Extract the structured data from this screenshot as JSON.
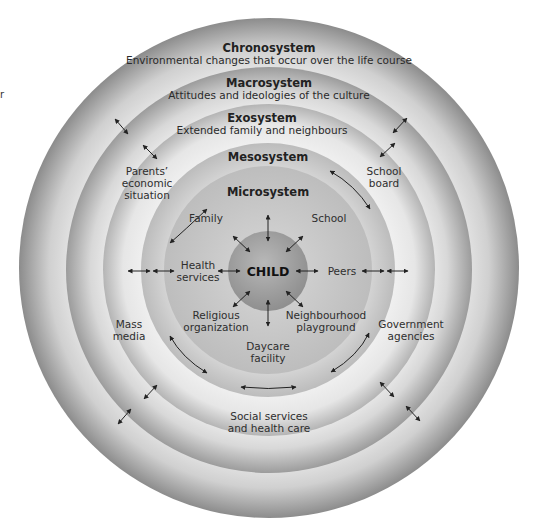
{
  "edge_fragment": "r",
  "systems": {
    "chronosystem": {
      "title": "Chronosystem",
      "subtitle": "Environmental changes that occur over the life course"
    },
    "macrosystem": {
      "title": "Macrosystem",
      "subtitle": "Attitudes and ideologies of the culture"
    },
    "exosystem": {
      "title": "Exosystem",
      "subtitle": "Extended family and neighbours"
    },
    "mesosystem": {
      "title": "Mesosystem"
    },
    "microsystem": {
      "title": "Microsystem"
    }
  },
  "center": {
    "label": "CHILD"
  },
  "microsystem_items": {
    "family": "Family",
    "school": "School",
    "health_services": [
      "Health",
      "services"
    ],
    "peers": "Peers",
    "religious_organization": [
      "Religious",
      "organization"
    ],
    "neighbourhood_playground": [
      "Neighbourhood",
      "playground"
    ],
    "daycare_facility": [
      "Daycare",
      "facility"
    ]
  },
  "exosystem_items": {
    "parents_economic_situation": [
      "Parents’",
      "economic",
      "situation"
    ],
    "school_board": [
      "School",
      "board"
    ],
    "mass_media": [
      "Mass",
      "media"
    ],
    "government_agencies": [
      "Government",
      "agencies"
    ],
    "social_services": [
      "Social services",
      "and health care"
    ]
  },
  "colors": {
    "chrono_edge": "#8e8e8e",
    "chrono_inner": "#d6d6d6",
    "macro_edge": "#9a9a9a",
    "macro_inner": "#e4e4e4",
    "exo_edge": "#b0b0b0",
    "exo_inner": "#f0f0f0",
    "meso": "#bdbdbd",
    "micro": "#c9c9c9",
    "child": "#9e9e9e",
    "arrow": "#222222"
  }
}
